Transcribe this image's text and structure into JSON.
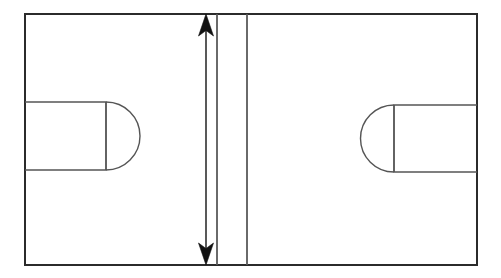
{
  "figure": {
    "background_color": "#ffffff",
    "line_color": "#2b2b2b",
    "thin_line_color": "#555555",
    "arrow_color": "#111111",
    "canvas": {
      "width": 501,
      "height": 278
    }
  },
  "outer_frame": {
    "name": "outer rectangle",
    "x": 25,
    "y": 14,
    "width": 452,
    "height": 251
  },
  "dividers": [
    {
      "name": "center line left",
      "x": 217,
      "y1": 14,
      "y2": 265
    },
    {
      "name": "center line right",
      "x": 247,
      "y1": 14,
      "y2": 265
    }
  ],
  "dimension_arrow": {
    "name": "vertical double headed dimension arrow",
    "x": 206,
    "y_top": 14,
    "y_bottom": 265,
    "head_length": 22,
    "head_width": 15,
    "double_headed": true,
    "direction": "vertical"
  },
  "slots": [
    {
      "name": "left slot",
      "side": "left",
      "rect_x": 25,
      "rect_y": 102,
      "rect_width": 81,
      "rect_height": 68,
      "cap_side": "right",
      "cap_radius": 34,
      "cap_tip_x": 141,
      "divider_line_x": 106
    },
    {
      "name": "right slot",
      "side": "right",
      "rect_x": 394,
      "rect_y": 105,
      "rect_width": 83,
      "rect_height": 67,
      "cap_side": "left",
      "cap_radius": 33.5,
      "cap_tip_x": 356,
      "divider_line_x": 394
    }
  ],
  "labels": {
    "none": ""
  }
}
